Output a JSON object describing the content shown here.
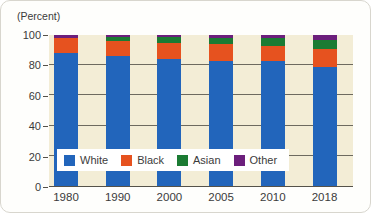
{
  "chart": {
    "unit_label": "(Percent)"
  },
  "colors": {
    "plot_background": "#f3edd6",
    "gridline": "#55524a",
    "text": "#3b3b3b",
    "legend_background": "#ffffff",
    "white_series": "#2265bb",
    "black_series": "#e6521f",
    "asian_series": "#1b7b33",
    "other_series": "#6c1f7c"
  },
  "chart_data": {
    "type": "bar",
    "stacked": true,
    "title": "",
    "ylabel": "(Percent)",
    "xlabel": "",
    "ylim": [
      0,
      100
    ],
    "yticks": [
      0,
      20,
      40,
      60,
      80,
      100
    ],
    "grid": true,
    "legend_position": "inside-bottom-left",
    "categories": [
      "1980",
      "1990",
      "2000",
      "2005",
      "2010",
      "2018"
    ],
    "series": [
      {
        "name": "White",
        "color": "#2265bb",
        "values": [
          88,
          86,
          84,
          83,
          83,
          79
        ]
      },
      {
        "name": "Black",
        "color": "#e6521f",
        "values": [
          10,
          10,
          11,
          11,
          10,
          12
        ]
      },
      {
        "name": "Asian",
        "color": "#1b7b33",
        "values": [
          0,
          3,
          4,
          4,
          5,
          6
        ]
      },
      {
        "name": "Other",
        "color": "#6c1f7c",
        "values": [
          2,
          1,
          1,
          2,
          2,
          3
        ]
      }
    ]
  }
}
